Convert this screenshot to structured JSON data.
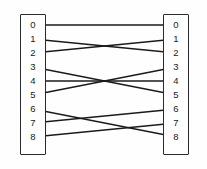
{
  "diagram": {
    "type": "bipartite-permutation-mapping",
    "stroke_color": "#1a1a1a",
    "box_border_color": "#2b2b2b",
    "background_color": "#ffffff",
    "left_column": {
      "name": "left-node-column",
      "x": 20,
      "y": 14,
      "width": 26,
      "height": 141,
      "port_x": 33,
      "nodes": [
        {
          "label": "0",
          "y": 25
        },
        {
          "label": "1",
          "y": 39
        },
        {
          "label": "2",
          "y": 53
        },
        {
          "label": "3",
          "y": 67
        },
        {
          "label": "4",
          "y": 81
        },
        {
          "label": "5",
          "y": 95
        },
        {
          "label": "6",
          "y": 109
        },
        {
          "label": "7",
          "y": 123
        },
        {
          "label": "8",
          "y": 137
        }
      ]
    },
    "right_column": {
      "name": "right-node-column",
      "x": 163,
      "y": 14,
      "width": 26,
      "height": 141,
      "port_x": 176,
      "nodes": [
        {
          "label": "0",
          "y": 25
        },
        {
          "label": "1",
          "y": 39
        },
        {
          "label": "2",
          "y": 53
        },
        {
          "label": "3",
          "y": 67
        },
        {
          "label": "4",
          "y": 81
        },
        {
          "label": "5",
          "y": 95
        },
        {
          "label": "6",
          "y": 109
        },
        {
          "label": "7",
          "y": 123
        },
        {
          "label": "8",
          "y": 137
        }
      ]
    },
    "edges": [
      {
        "name": "edge-0-to-0",
        "from": 0,
        "to": 0,
        "arrow_left": true,
        "arrow_right": true
      },
      {
        "name": "edge-1-to-2",
        "from": 1,
        "to": 2,
        "arrow_left": true,
        "arrow_right": true
      },
      {
        "name": "edge-2-to-1",
        "from": 2,
        "to": 1,
        "arrow_left": true,
        "arrow_right": true
      },
      {
        "name": "edge-3-to-5",
        "from": 3,
        "to": 5,
        "arrow_left": true,
        "arrow_right": true
      },
      {
        "name": "edge-4-to-4",
        "from": 4,
        "to": 4,
        "arrow_left": true,
        "arrow_right": true
      },
      {
        "name": "edge-5-to-3",
        "from": 5,
        "to": 3,
        "arrow_left": true,
        "arrow_right": true
      },
      {
        "name": "edge-6-to-8",
        "from": 6,
        "to": 8,
        "arrow_left": true,
        "arrow_right": true
      },
      {
        "name": "edge-7-to-6",
        "from": 7,
        "to": 6,
        "arrow_left": true,
        "arrow_right": true
      },
      {
        "name": "edge-8-to-7",
        "from": 8,
        "to": 7,
        "arrow_left": true,
        "arrow_right": true
      }
    ]
  }
}
